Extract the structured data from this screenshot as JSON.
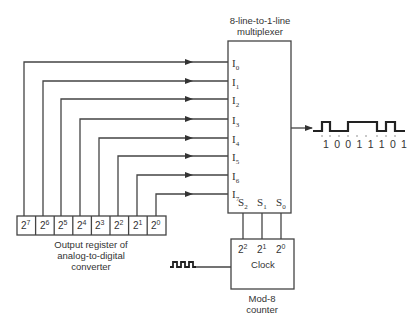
{
  "multiplexer": {
    "title_line1": "8-line-to-1-line",
    "title_line2": "multiplexer",
    "inputs": [
      {
        "name": "I",
        "sub": "0"
      },
      {
        "name": "I",
        "sub": "1"
      },
      {
        "name": "I",
        "sub": "2"
      },
      {
        "name": "I",
        "sub": "3"
      },
      {
        "name": "I",
        "sub": "4"
      },
      {
        "name": "I",
        "sub": "5"
      },
      {
        "name": "I",
        "sub": "6"
      },
      {
        "name": "I",
        "sub": "7"
      }
    ],
    "selects": [
      {
        "name": "S",
        "sub": "2"
      },
      {
        "name": "S",
        "sub": "1"
      },
      {
        "name": "S",
        "sub": "0"
      }
    ]
  },
  "register": {
    "cells": [
      {
        "base": "2",
        "exp": "7"
      },
      {
        "base": "2",
        "exp": "6"
      },
      {
        "base": "2",
        "exp": "5"
      },
      {
        "base": "2",
        "exp": "4"
      },
      {
        "base": "2",
        "exp": "3"
      },
      {
        "base": "2",
        "exp": "2"
      },
      {
        "base": "2",
        "exp": "1"
      },
      {
        "base": "2",
        "exp": "0"
      }
    ],
    "caption_line1": "Output register of",
    "caption_line2": "analog-to-digital",
    "caption_line3": "converter"
  },
  "counter": {
    "outputs": [
      {
        "base": "2",
        "exp": "2"
      },
      {
        "base": "2",
        "exp": "1"
      },
      {
        "base": "2",
        "exp": "0"
      }
    ],
    "clock_label": "Clock",
    "caption_line1": "Mod-8",
    "caption_line2": "counter"
  },
  "output_waveform": {
    "bits_label": "1 0 0 1 1 1 0 1",
    "bits": [
      1,
      0,
      0,
      1,
      1,
      1,
      0,
      1
    ]
  },
  "colors": {
    "line": "#444444",
    "text": "#333333",
    "background": "#ffffff"
  }
}
